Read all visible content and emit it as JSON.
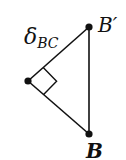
{
  "diagram": {
    "type": "right-triangle",
    "labels": {
      "delta": "δ",
      "delta_subscript": "BC",
      "b_prime": "B′",
      "b": "B"
    },
    "points": {
      "vertex": {
        "x": 28,
        "y": 81
      },
      "b_prime": {
        "x": 89,
        "y": 27
      },
      "b": {
        "x": 89,
        "y": 134
      }
    },
    "right_angle_marker": true,
    "colors": {
      "line": "#111111",
      "point": "#111111",
      "background": "#ffffff"
    }
  }
}
